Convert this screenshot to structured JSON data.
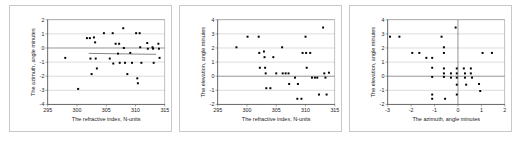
{
  "figure": {
    "panel_count": 3,
    "background_color": "#ffffff",
    "border_color": "#c8c8c8",
    "point_color": "#000000",
    "grid_color": "#b0b0b0"
  },
  "chart_data": [
    {
      "type": "scatter",
      "title": "",
      "xlabel": "The refractive index, N-units",
      "ylabel": "The azimuth, angle minutes",
      "xlim": [
        295,
        315
      ],
      "ylim": [
        -4,
        2
      ],
      "xticks": [
        295,
        300,
        305,
        310,
        315
      ],
      "yticks": [
        2,
        1,
        0,
        -1,
        -2,
        -3,
        -4
      ],
      "grid": true,
      "legend": "none",
      "points": [
        {
          "x": 298.0,
          "y": -0.7
        },
        {
          "x": 300.2,
          "y": -2.9
        },
        {
          "x": 301.7,
          "y": 0.7
        },
        {
          "x": 302.2,
          "y": 0.7
        },
        {
          "x": 302.3,
          "y": -0.75
        },
        {
          "x": 302.5,
          "y": -1.85
        },
        {
          "x": 302.9,
          "y": 0.75
        },
        {
          "x": 303.1,
          "y": 0.4
        },
        {
          "x": 303.2,
          "y": -0.75
        },
        {
          "x": 303.4,
          "y": -1.45
        },
        {
          "x": 304.6,
          "y": 1.05
        },
        {
          "x": 305.6,
          "y": -0.75
        },
        {
          "x": 306.1,
          "y": 1.05
        },
        {
          "x": 306.2,
          "y": -1.1
        },
        {
          "x": 306.6,
          "y": 0.3
        },
        {
          "x": 307.0,
          "y": -0.4
        },
        {
          "x": 307.2,
          "y": 0.3
        },
        {
          "x": 307.3,
          "y": -1.05
        },
        {
          "x": 307.9,
          "y": 1.4
        },
        {
          "x": 308.0,
          "y": 0.0
        },
        {
          "x": 308.2,
          "y": -1.05
        },
        {
          "x": 308.6,
          "y": -1.85
        },
        {
          "x": 309.1,
          "y": -0.35
        },
        {
          "x": 309.4,
          "y": -1.05
        },
        {
          "x": 310.1,
          "y": 1.05
        },
        {
          "x": 310.3,
          "y": -2.15
        },
        {
          "x": 310.4,
          "y": -2.5
        },
        {
          "x": 310.7,
          "y": 1.05
        },
        {
          "x": 310.8,
          "y": 0.05
        },
        {
          "x": 311.0,
          "y": -1.05
        },
        {
          "x": 312.0,
          "y": 0.35
        },
        {
          "x": 312.1,
          "y": -0.05
        },
        {
          "x": 312.9,
          "y": 0.05
        },
        {
          "x": 313.0,
          "y": -0.05
        },
        {
          "x": 313.1,
          "y": -1.05
        },
        {
          "x": 313.9,
          "y": 0.3
        },
        {
          "x": 314.0,
          "y": -0.05
        },
        {
          "x": 314.1,
          "y": -0.7
        }
      ],
      "trendline": {
        "x0": 302.0,
        "y0": -0.38,
        "x1": 313.5,
        "y1": -0.45
      }
    },
    {
      "type": "scatter",
      "title": "",
      "xlabel": "The refractive index, N-units",
      "ylabel": "The elevation, angle minutes",
      "xlim": [
        295,
        315
      ],
      "ylim": [
        -2,
        4
      ],
      "xticks": [
        295,
        300,
        305,
        310,
        315
      ],
      "yticks": [
        4,
        3,
        2,
        1,
        0,
        -1,
        -2
      ],
      "grid": true,
      "legend": "none",
      "points": [
        {
          "x": 298.2,
          "y": 2.05
        },
        {
          "x": 300.1,
          "y": 2.8
        },
        {
          "x": 302.0,
          "y": 2.8
        },
        {
          "x": 302.1,
          "y": 1.65
        },
        {
          "x": 302.2,
          "y": 0.6
        },
        {
          "x": 302.9,
          "y": 1.75
        },
        {
          "x": 303.0,
          "y": 1.35
        },
        {
          "x": 303.1,
          "y": 0.6
        },
        {
          "x": 303.2,
          "y": 0.2
        },
        {
          "x": 303.3,
          "y": -0.85
        },
        {
          "x": 304.0,
          "y": -0.85
        },
        {
          "x": 304.5,
          "y": 1.35
        },
        {
          "x": 305.0,
          "y": 0.2
        },
        {
          "x": 306.0,
          "y": 2.05
        },
        {
          "x": 306.1,
          "y": 0.2
        },
        {
          "x": 306.6,
          "y": 0.2
        },
        {
          "x": 307.1,
          "y": 0.2
        },
        {
          "x": 307.2,
          "y": -0.55
        },
        {
          "x": 308.2,
          "y": -0.1
        },
        {
          "x": 308.6,
          "y": -1.6
        },
        {
          "x": 308.7,
          "y": -0.55
        },
        {
          "x": 309.3,
          "y": -1.6
        },
        {
          "x": 309.5,
          "y": 1.65
        },
        {
          "x": 310.0,
          "y": 2.8
        },
        {
          "x": 310.1,
          "y": 1.65
        },
        {
          "x": 310.2,
          "y": 0.6
        },
        {
          "x": 310.8,
          "y": 1.65
        },
        {
          "x": 311.1,
          "y": -0.1
        },
        {
          "x": 311.6,
          "y": -0.1
        },
        {
          "x": 312.0,
          "y": -0.1
        },
        {
          "x": 312.3,
          "y": -1.3
        },
        {
          "x": 313.0,
          "y": 3.45
        },
        {
          "x": 313.2,
          "y": 0.2
        },
        {
          "x": 313.4,
          "y": -0.1
        },
        {
          "x": 313.6,
          "y": -1.3
        },
        {
          "x": 314.0,
          "y": 0.25
        }
      ]
    },
    {
      "type": "scatter",
      "title": "",
      "xlabel": "The azimuth, angle minutes",
      "ylabel": "The elevation, angle minutes",
      "xlim": [
        -3,
        2
      ],
      "ylim": [
        -2,
        4
      ],
      "xticks": [
        -3,
        -2,
        -1,
        0,
        1,
        2
      ],
      "yticks": [
        4,
        3,
        2,
        1,
        0,
        -1,
        -2
      ],
      "grid": true,
      "legend": "none",
      "points": [
        {
          "x": -2.9,
          "y": 2.8
        },
        {
          "x": -2.5,
          "y": 2.8
        },
        {
          "x": -1.95,
          "y": 1.65
        },
        {
          "x": -1.65,
          "y": 1.65
        },
        {
          "x": -1.35,
          "y": 1.3
        },
        {
          "x": -1.1,
          "y": 1.3
        },
        {
          "x": -1.1,
          "y": 0.6
        },
        {
          "x": -1.1,
          "y": -0.05
        },
        {
          "x": -1.1,
          "y": -1.3
        },
        {
          "x": -1.1,
          "y": -1.6
        },
        {
          "x": -0.7,
          "y": 2.8
        },
        {
          "x": -0.6,
          "y": 2.05
        },
        {
          "x": -0.6,
          "y": 1.65
        },
        {
          "x": -0.6,
          "y": 0.2
        },
        {
          "x": -0.6,
          "y": -0.05
        },
        {
          "x": -0.6,
          "y": 0.55
        },
        {
          "x": -0.55,
          "y": -1.6
        },
        {
          "x": -0.3,
          "y": 0.2
        },
        {
          "x": -0.3,
          "y": -0.1
        },
        {
          "x": -0.1,
          "y": 3.45
        },
        {
          "x": -0.05,
          "y": 0.55
        },
        {
          "x": -0.05,
          "y": 0.2
        },
        {
          "x": -0.05,
          "y": -0.1
        },
        {
          "x": -0.05,
          "y": -0.6
        },
        {
          "x": -0.05,
          "y": -1.3
        },
        {
          "x": 0.25,
          "y": 0.55
        },
        {
          "x": 0.3,
          "y": 0.2
        },
        {
          "x": 0.3,
          "y": -0.1
        },
        {
          "x": 0.35,
          "y": -0.6
        },
        {
          "x": 0.55,
          "y": 0.55
        },
        {
          "x": 0.55,
          "y": 0.2
        },
        {
          "x": 0.6,
          "y": -0.1
        },
        {
          "x": 0.9,
          "y": -0.55
        },
        {
          "x": 0.95,
          "y": -1.05
        },
        {
          "x": 1.05,
          "y": 1.65
        },
        {
          "x": 1.45,
          "y": 1.65
        }
      ]
    }
  ]
}
